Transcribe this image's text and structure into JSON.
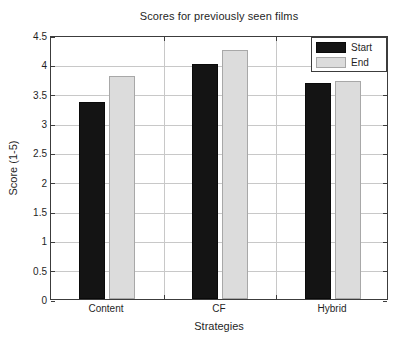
{
  "chart_data": {
    "type": "bar",
    "title": "Scores for previously seen films",
    "xlabel": "Strategies",
    "ylabel": "Score (1-5)",
    "categories": [
      "Content",
      "CF",
      "Hybrid"
    ],
    "series": [
      {
        "name": "Start",
        "color": "#141414",
        "values": [
          3.36,
          4.01,
          3.69
        ]
      },
      {
        "name": "End",
        "color": "#dcdcdc",
        "values": [
          3.8,
          4.24,
          3.71
        ]
      }
    ],
    "ylim": [
      0,
      4.5
    ],
    "yticks": [
      0,
      0.5,
      1,
      1.5,
      2,
      2.5,
      3,
      3.5,
      4,
      4.5
    ],
    "ytick_labels": [
      "0",
      "0.5",
      "1",
      "1.5",
      "2",
      "2.5",
      "3",
      "3.5",
      "4",
      "4.5"
    ],
    "grid": true,
    "grid_axis": "both",
    "legend_position": "top-right",
    "legend_entries": [
      "Start",
      "End"
    ]
  },
  "figure": {
    "background": "#ffffff",
    "axis_color": "#3c3c3c",
    "grid_color": "#c8c8c8"
  }
}
